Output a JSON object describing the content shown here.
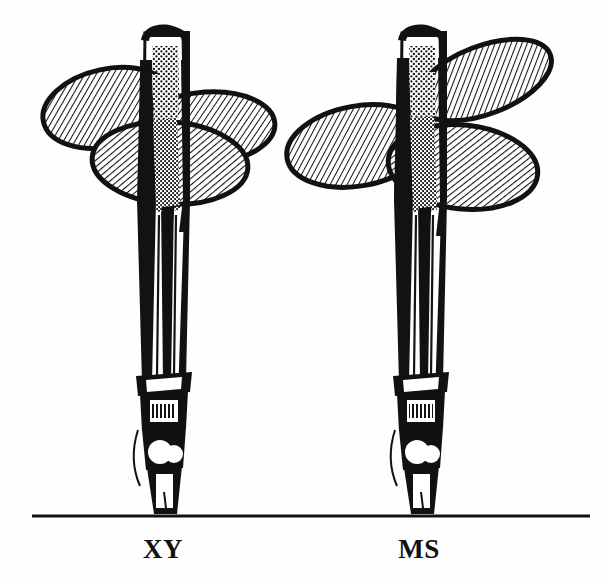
{
  "figure": {
    "background_color": "#fefefe",
    "ink_color": "#111111",
    "width": 609,
    "height": 585
  },
  "ground_line": {
    "name": "baseline",
    "x_start": 32,
    "x_end": 590,
    "y": 516,
    "thickness": 3,
    "color": "#111111"
  },
  "labels": {
    "left": "XY",
    "right": "MS"
  },
  "specimens": [
    {
      "id": "xy",
      "label": "XY",
      "label_x": 163,
      "label_y": 549,
      "shaft": {
        "top_y": 27,
        "bottom_y": 514,
        "center_x": 163,
        "width": 42
      },
      "lobes": [
        {
          "name": "upper-left-lobe",
          "cx": 108,
          "cy": 108,
          "rx": 66,
          "ry": 39,
          "rotate": -12,
          "hatch": "diag-right"
        },
        {
          "name": "right-lobe",
          "cx": 205,
          "cy": 128,
          "rx": 68,
          "ry": 36,
          "rotate": -4,
          "hatch": "diag-right"
        },
        {
          "name": "lower-lobe",
          "cx": 170,
          "cy": 162,
          "rx": 78,
          "ry": 40,
          "rotate": 4,
          "hatch": "diag-right"
        }
      ],
      "joints": [
        {
          "name": "upper-collar",
          "y": 378,
          "height": 20
        },
        {
          "name": "mid-joint",
          "y": 404,
          "height": 30
        },
        {
          "name": "lower-knuckle",
          "y": 440,
          "height": 28
        },
        {
          "name": "tip-segment",
          "y": 472,
          "height": 42
        }
      ]
    },
    {
      "id": "ms",
      "label": "MS",
      "label_x": 419,
      "label_y": 549,
      "shaft": {
        "top_y": 27,
        "bottom_y": 514,
        "center_x": 419,
        "width": 42
      },
      "lobes": [
        {
          "name": "upper-right-lobe",
          "cx": 480,
          "cy": 78,
          "rx": 70,
          "ry": 34,
          "rotate": -22,
          "hatch": "diag-right"
        },
        {
          "name": "left-lobe",
          "cx": 358,
          "cy": 145,
          "rx": 72,
          "ry": 40,
          "rotate": -10,
          "hatch": "diag-right"
        },
        {
          "name": "lower-right-lobe",
          "cx": 460,
          "cy": 165,
          "rx": 75,
          "ry": 42,
          "rotate": 6,
          "hatch": "diag-right"
        }
      ],
      "joints": [
        {
          "name": "upper-collar",
          "y": 378,
          "height": 20
        },
        {
          "name": "mid-joint",
          "y": 404,
          "height": 30
        },
        {
          "name": "lower-knuckle",
          "y": 440,
          "height": 28
        },
        {
          "name": "tip-segment",
          "y": 472,
          "height": 42
        }
      ]
    }
  ],
  "render": {
    "hatch_spacing": 5,
    "hatch_stroke_width": 2.1,
    "lobe_outline_width": 5,
    "stipple_dot_radius": 1.15
  }
}
